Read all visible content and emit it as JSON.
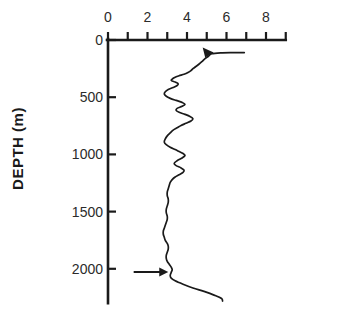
{
  "figure": {
    "kind": "depth-profile-line-plot",
    "background_color": "#ffffff",
    "ink_color": "#1a1a1a"
  },
  "chart_data": {
    "type": "line",
    "title": "",
    "xlabel": "",
    "ylabel": "DEPTH (m)",
    "orientation": "vertical-profile",
    "grid": false,
    "legend": null,
    "xlim": [
      0,
      9
    ],
    "ylim": [
      0,
      2300
    ],
    "y_inverted": true,
    "xticks": [
      0,
      1,
      2,
      3,
      4,
      5,
      6,
      7,
      8,
      9
    ],
    "xtick_labels": [
      "0",
      "",
      "2",
      "",
      "4",
      "",
      "6",
      "",
      "8",
      ""
    ],
    "xtick_labels_shown": [
      "0",
      "2",
      "4",
      "6",
      "8"
    ],
    "xtick_label_values": [
      0,
      2,
      4,
      6,
      8
    ],
    "yticks": [
      0,
      500,
      1000,
      1500,
      2000
    ],
    "ytick_labels": [
      "0",
      "500",
      "1000",
      "1500",
      "2000"
    ],
    "series": [
      {
        "name": "profile",
        "x": [
          6.9,
          6.3,
          5.7,
          5.25,
          5.1,
          4.9,
          4.75,
          4.6,
          4.45,
          4.3,
          4.2,
          4.05,
          3.85,
          3.6,
          3.45,
          3.3,
          3.2,
          3.4,
          3.55,
          3.5,
          3.3,
          3.05,
          2.9,
          2.85,
          2.95,
          3.15,
          3.45,
          3.75,
          3.9,
          3.75,
          3.5,
          3.45,
          3.6,
          3.9,
          4.15,
          4.3,
          4.2,
          3.95,
          3.7,
          3.5,
          3.3,
          3.15,
          3.0,
          2.9,
          2.85,
          2.95,
          3.15,
          3.4,
          3.6,
          3.8,
          3.9,
          3.75,
          3.5,
          3.35,
          3.45,
          3.7,
          3.85,
          3.8,
          3.6,
          3.4,
          3.25,
          3.15,
          3.1,
          3.05,
          3.0,
          3.0,
          3.05,
          3.05,
          3.0,
          2.95,
          2.95,
          3.0,
          3.0,
          2.95,
          2.9,
          2.85,
          2.8,
          2.8,
          2.85,
          2.9,
          3.0,
          3.05,
          3.05,
          3.0,
          2.95,
          2.95,
          3.0,
          3.1,
          3.2,
          3.25,
          3.2,
          3.15,
          3.2,
          3.4,
          3.8,
          4.3,
          4.9,
          5.4,
          5.75,
          5.8
        ],
        "y": [
          110,
          110,
          112,
          120,
          140,
          165,
          190,
          212,
          232,
          250,
          268,
          285,
          300,
          312,
          322,
          335,
          352,
          368,
          382,
          398,
          415,
          432,
          452,
          472,
          492,
          510,
          528,
          545,
          562,
          580,
          598,
          615,
          632,
          650,
          668,
          688,
          708,
          728,
          748,
          768,
          788,
          812,
          838,
          865,
          892,
          915,
          938,
          958,
          975,
          992,
          1010,
          1032,
          1055,
          1078,
          1098,
          1118,
          1138,
          1158,
          1178,
          1198,
          1220,
          1245,
          1272,
          1300,
          1330,
          1360,
          1390,
          1420,
          1450,
          1480,
          1510,
          1540,
          1568,
          1595,
          1620,
          1645,
          1670,
          1698,
          1725,
          1752,
          1778,
          1802,
          1828,
          1855,
          1882,
          1908,
          1935,
          1960,
          1985,
          2008,
          2032,
          2058,
          2082,
          2105,
          2135,
          2168,
          2200,
          2232,
          2260,
          2282
        ]
      }
    ],
    "annotations": [
      {
        "name": "upper-arrow",
        "type": "arrow",
        "direction": "right",
        "x_tip": 5.2,
        "y": 118,
        "note": "arrowhead on profile near top"
      },
      {
        "name": "lower-arrow",
        "type": "arrow",
        "direction": "right",
        "x_tip": 3.05,
        "y": 2028,
        "x_tail": 1.3,
        "note": "horizontal arrow pointing at profile near 2030 m"
      }
    ]
  }
}
